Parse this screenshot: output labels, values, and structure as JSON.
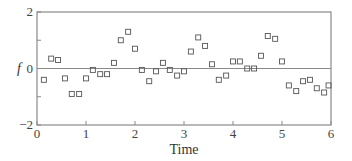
{
  "chart_data": {
    "type": "scatter",
    "title": "",
    "xlabel": "Time",
    "ylabel": "f",
    "xlim": [
      0,
      6
    ],
    "ylim": [
      -2,
      2
    ],
    "xticks": [
      0,
      1,
      2,
      3,
      4,
      5,
      6
    ],
    "yticks": [
      -2,
      -1,
      0,
      1,
      2
    ],
    "ytick_labels": [
      "-2",
      "",
      "0",
      "",
      "2"
    ],
    "xtick_labels": [
      "0",
      "1",
      "2",
      "3",
      "4",
      "5",
      "6"
    ],
    "grid": false,
    "reference_line": {
      "y": 0
    },
    "marker": "open-square",
    "series": [
      {
        "name": "f",
        "x": [
          0.14,
          0.29,
          0.43,
          0.57,
          0.71,
          0.86,
          1.0,
          1.14,
          1.29,
          1.43,
          1.57,
          1.71,
          1.86,
          2.0,
          2.14,
          2.29,
          2.43,
          2.57,
          2.71,
          2.86,
          3.0,
          3.14,
          3.29,
          3.43,
          3.57,
          3.71,
          3.86,
          4.0,
          4.14,
          4.29,
          4.43,
          4.57,
          4.71,
          4.86,
          5.0,
          5.14,
          5.29,
          5.43,
          5.57,
          5.71,
          5.86,
          5.95
        ],
        "y": [
          -0.4,
          0.35,
          0.3,
          -0.35,
          -0.9,
          -0.9,
          -0.35,
          -0.05,
          -0.2,
          -0.2,
          0.2,
          1.0,
          1.3,
          0.7,
          -0.05,
          -0.45,
          -0.1,
          0.2,
          -0.05,
          -0.25,
          -0.1,
          0.6,
          1.1,
          0.8,
          0.15,
          -0.4,
          -0.25,
          0.25,
          0.25,
          0.0,
          0.0,
          0.45,
          1.15,
          1.05,
          0.25,
          -0.6,
          -0.8,
          -0.45,
          -0.4,
          -0.7,
          -0.85,
          -0.6
        ]
      }
    ],
    "legend": null
  },
  "axis_color": "#8a8a8a",
  "marker_color": "#555555"
}
